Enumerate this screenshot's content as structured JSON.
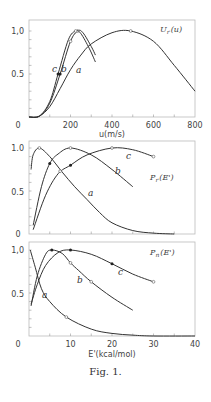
{
  "figure": {
    "caption": "Fig. 1."
  },
  "chart_data": [
    {
      "type": "line",
      "title": "",
      "annotation": "U_r(u)",
      "xlabel": "u(m/s)",
      "ylabel": "",
      "xlim": [
        0,
        800
      ],
      "ylim": [
        0,
        1.0
      ],
      "xticks": [
        0,
        200,
        400,
        600,
        800
      ],
      "yticks": [
        0.5,
        1.0
      ],
      "ytick_labels": [
        "0",
        "0.5",
        "1,0"
      ],
      "series": [
        {
          "name": "a",
          "x": [
            0,
            50,
            100,
            150,
            200,
            250,
            300,
            400,
            490,
            600,
            700,
            800
          ],
          "values": [
            0,
            0.01,
            0.12,
            0.33,
            0.55,
            0.72,
            0.85,
            0.98,
            1.0,
            0.88,
            0.6,
            0.3
          ],
          "open_markers": [
            [
              490,
              1.0
            ]
          ],
          "filled_markers": []
        },
        {
          "name": "b",
          "x": [
            0,
            50,
            100,
            150,
            200,
            235,
            260,
            300,
            320
          ],
          "values": [
            0,
            0.01,
            0.16,
            0.5,
            0.88,
            1.0,
            0.98,
            0.82,
            0.72
          ],
          "open_markers": [
            [
              200,
              0.88
            ],
            [
              235,
              1.0
            ]
          ],
          "filled_markers": [
            [
              150,
              0.5
            ]
          ]
        },
        {
          "name": "c",
          "x": [
            0,
            50,
            100,
            140,
            190,
            225,
            250,
            290,
            320
          ],
          "values": [
            0,
            0.01,
            0.18,
            0.5,
            0.9,
            1.0,
            0.97,
            0.8,
            0.64
          ],
          "open_markers": [
            [
              225,
              1.0
            ]
          ],
          "filled_markers": [
            [
              140,
              0.5
            ]
          ]
        }
      ],
      "legend": "inline labels a, b, c"
    },
    {
      "type": "line",
      "title": "",
      "annotation": "P_r(E')",
      "xlabel": "",
      "ylabel": "",
      "xlim": [
        0,
        40
      ],
      "ylim": [
        0,
        1.0
      ],
      "yticks": [
        0.5,
        1.0
      ],
      "ytick_labels": [
        "0",
        "0.5",
        "1.0"
      ],
      "series": [
        {
          "name": "a",
          "x": [
            0.5,
            1,
            2.5,
            5,
            8,
            11,
            14,
            17,
            20,
            25,
            30,
            35
          ],
          "values": [
            0.75,
            0.92,
            1.0,
            0.9,
            0.72,
            0.55,
            0.4,
            0.25,
            0.13,
            0.04,
            0.01,
            0.0
          ],
          "open_markers": [
            [
              2.5,
              1.0
            ]
          ],
          "filled_markers": []
        },
        {
          "name": "b",
          "x": [
            1,
            3,
            5,
            7,
            10,
            15,
            20,
            25
          ],
          "values": [
            0.1,
            0.55,
            0.82,
            0.93,
            1.0,
            0.92,
            0.75,
            0.55
          ],
          "open_markers": [
            [
              10,
              1.0
            ]
          ],
          "filled_markers": [
            [
              5,
              0.82
            ]
          ]
        },
        {
          "name": "c",
          "x": [
            1,
            4,
            7,
            10,
            14,
            20,
            25,
            30
          ],
          "values": [
            0.05,
            0.45,
            0.7,
            0.8,
            0.92,
            1.0,
            0.98,
            0.9
          ],
          "open_markers": [
            [
              20,
              1.0
            ],
            [
              30,
              0.9
            ],
            [
              7.5,
              0.73
            ]
          ],
          "filled_markers": [
            [
              10,
              0.8
            ]
          ]
        }
      ],
      "legend": "inline labels a, b, c"
    },
    {
      "type": "line",
      "title": "",
      "annotation": "P_n(E')",
      "xlabel": "E'(kcal/mol)",
      "ylabel": "",
      "xlim": [
        0,
        40
      ],
      "ylim": [
        0,
        1.0
      ],
      "xticks": [
        0,
        10,
        20,
        30,
        40
      ],
      "yticks": [
        0.5,
        1.0
      ],
      "ytick_labels": [
        "0",
        "0.5",
        "1,0"
      ],
      "series": [
        {
          "name": "a",
          "x": [
            0.3,
            1.5,
            3,
            5,
            9,
            15,
            20,
            25,
            30,
            40
          ],
          "values": [
            1.0,
            0.8,
            0.55,
            0.4,
            0.22,
            0.08,
            0.03,
            0.01,
            0.0,
            0.0
          ],
          "open_markers": [
            [
              9,
              0.22
            ]
          ],
          "filled_markers": []
        },
        {
          "name": "b",
          "x": [
            0.5,
            2,
            4,
            5.5,
            8,
            10,
            12,
            15,
            20,
            25
          ],
          "values": [
            0.35,
            0.7,
            0.95,
            1.0,
            0.96,
            0.85,
            0.76,
            0.63,
            0.45,
            0.3
          ],
          "open_markers": [
            [
              10,
              0.85
            ],
            [
              15,
              0.63
            ]
          ],
          "filled_markers": [
            [
              5.5,
              1.0
            ]
          ]
        },
        {
          "name": "c",
          "x": [
            0.5,
            2,
            4,
            7,
            10,
            15,
            20,
            25,
            30
          ],
          "values": [
            0.37,
            0.6,
            0.82,
            0.97,
            1.0,
            0.95,
            0.84,
            0.72,
            0.63
          ],
          "open_markers": [
            [
              30,
              0.63
            ]
          ],
          "filled_markers": [
            [
              10,
              1.0
            ],
            [
              20,
              0.84
            ]
          ]
        }
      ],
      "legend": "inline labels a, b, c"
    }
  ],
  "labels": {
    "p1": {
      "annotation_main": "U",
      "annotation_sub": "r",
      "annotation_arg": "(u)",
      "xlabel": "u(m/s)",
      "y0": "0",
      "y05": "0.5",
      "y1": "1,0",
      "x": [
        "200",
        "400",
        "600",
        "800"
      ],
      "a": "a",
      "b": "b",
      "c": "c"
    },
    "p2": {
      "annotation_main": "P",
      "annotation_sub": "r",
      "annotation_arg": "(E')",
      "y0": "0",
      "y05": "0.5",
      "y1": "1.0",
      "a": "a",
      "b": "b",
      "c": "c"
    },
    "p3": {
      "annotation_main": "P",
      "annotation_sub": "n",
      "annotation_arg": "(E')",
      "xlabel": "E'(kcal/mol)",
      "y0": "0",
      "y05": "0.5",
      "y1": "1,0",
      "x": [
        "0",
        "10",
        "20",
        "30",
        "40"
      ],
      "a": "a",
      "b": "b",
      "c": "c"
    }
  }
}
